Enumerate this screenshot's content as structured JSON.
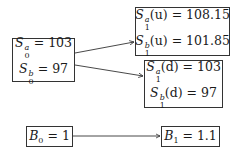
{
  "diagram": {
    "type": "two-state price tree",
    "nodes": {
      "s0": {
        "lines": [
          {
            "symbol": "S",
            "sup": "a",
            "sub": "0",
            "arg": "",
            "value": "103"
          },
          {
            "symbol": "S",
            "sup": "b",
            "sub": "0",
            "arg": "",
            "value": "97"
          }
        ]
      },
      "s1u": {
        "lines": [
          {
            "symbol": "S",
            "sup": "a",
            "sub": "1",
            "arg": "(u)",
            "value": "108.15"
          },
          {
            "symbol": "S",
            "sup": "b",
            "sub": "1",
            "arg": "(u)",
            "value": "101.85"
          }
        ]
      },
      "s1d": {
        "lines": [
          {
            "symbol": "S",
            "sup": "a",
            "sub": "1",
            "arg": "(d)",
            "value": "103"
          },
          {
            "symbol": "S",
            "sup": "b",
            "sub": "1",
            "arg": "(d)",
            "value": "97"
          }
        ]
      },
      "b0": {
        "lines": [
          {
            "symbol": "B",
            "sup": "",
            "sub": "0",
            "arg": "",
            "value": "1"
          }
        ]
      },
      "b1": {
        "lines": [
          {
            "symbol": "B",
            "sup": "",
            "sub": "1",
            "arg": "",
            "value": "1.1"
          }
        ]
      }
    },
    "edges": [
      {
        "from": "s0",
        "to": "s1u"
      },
      {
        "from": "s0",
        "to": "s1d"
      },
      {
        "from": "b0",
        "to": "b1"
      }
    ],
    "equals_sign": "="
  }
}
